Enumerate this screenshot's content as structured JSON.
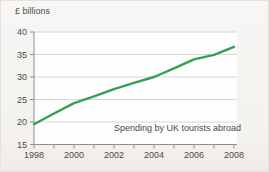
{
  "chart_data": {
    "type": "line",
    "title": "",
    "ylabel": "£ billions",
    "xlabel": "",
    "annotation": "Spending by UK tourists abroad",
    "x": [
      1998,
      1999,
      2000,
      2001,
      2002,
      2003,
      2004,
      2005,
      2006,
      2007,
      2008
    ],
    "x_tick_labels": [
      "1998",
      "2000",
      "2002",
      "2004",
      "2006",
      "2008"
    ],
    "series": [
      {
        "name": "Spending by UK tourists abroad",
        "values": [
          19.5,
          21.9,
          24.2,
          25.7,
          27.3,
          28.7,
          30.0,
          31.9,
          33.9,
          34.9,
          36.7
        ]
      }
    ],
    "ylim": [
      15,
      40
    ],
    "yticks": [
      15,
      20,
      25,
      30,
      35,
      40
    ],
    "grid": true,
    "legend_position": "none",
    "colors": {
      "line": "#33a053",
      "text": "#4b4a47",
      "grid": "#d8d6d2",
      "axis": "#8f8e8a",
      "plot_bg": "#fefefe",
      "card_bg": "#f5f3f0"
    }
  }
}
